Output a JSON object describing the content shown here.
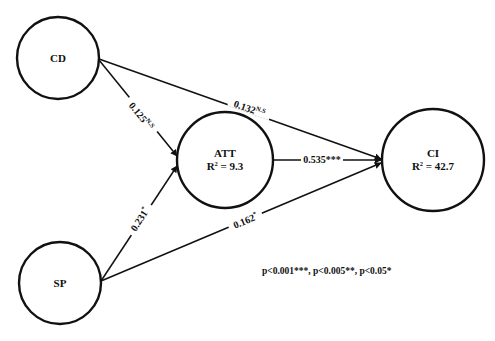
{
  "diagram": {
    "type": "structural-path-model",
    "nodes": [
      {
        "id": "CD",
        "label": "CD",
        "r2": null,
        "cx": 58,
        "cy": 58,
        "r": 41
      },
      {
        "id": "SP",
        "label": "SP",
        "r2": null,
        "cx": 60,
        "cy": 283,
        "r": 41
      },
      {
        "id": "ATT",
        "label": "ATT",
        "r2": "R² = 9.3",
        "cx": 225,
        "cy": 160,
        "r": 48
      },
      {
        "id": "CI",
        "label": "CI",
        "r2": "R² = 42.7",
        "cx": 433,
        "cy": 160,
        "r": 51
      }
    ],
    "edges": [
      {
        "from": "CD",
        "to": "ATT",
        "coef": "0.125",
        "sig": "N.S"
      },
      {
        "from": "CD",
        "to": "CI",
        "coef": "0.132",
        "sig": "N.S"
      },
      {
        "from": "SP",
        "to": "ATT",
        "coef": "0.231",
        "sig": "*"
      },
      {
        "from": "SP",
        "to": "CI",
        "coef": "0.162",
        "sig": "*"
      },
      {
        "from": "ATT",
        "to": "CI",
        "coef": "0.535",
        "sig": "***"
      }
    ],
    "legend": "p<0.001***, p<0.005**, p<0.05*",
    "colors": {
      "stroke": "#111111",
      "background": "#ffffff"
    }
  },
  "nodes": {
    "cd": {
      "label": "CD"
    },
    "sp": {
      "label": "SP"
    },
    "att": {
      "label": "ATT",
      "r2": "R",
      "r2_sup": "2",
      "r2_val": " = 9.3"
    },
    "ci": {
      "label": "CI",
      "r2": "R",
      "r2_sup": "2",
      "r2_val": " = 42.7"
    }
  },
  "edges": {
    "cd_att": {
      "coef": "0.125",
      "sig": "N.S"
    },
    "cd_ci": {
      "coef": "0.132",
      "sig": "N.S"
    },
    "sp_att": {
      "coef": "0.231",
      "sig": "*"
    },
    "sp_ci": {
      "coef": "0.162",
      "sig": "*"
    },
    "att_ci": {
      "coef": "0.535",
      "sig": "***"
    }
  },
  "legend": {
    "text": "p<0.001***, p<0.005**, p<0.05*"
  }
}
